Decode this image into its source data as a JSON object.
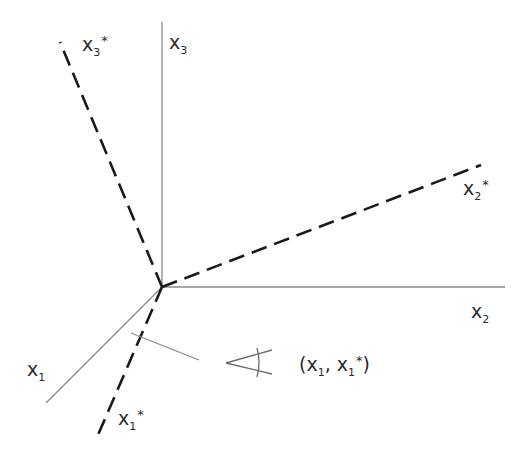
{
  "diagram": {
    "title": "",
    "origin": [
      162,
      287
    ],
    "axes": [
      {
        "id": "x3",
        "label": "x",
        "sub": "3",
        "star": "",
        "style": "solid",
        "end": [
          162,
          22
        ]
      },
      {
        "id": "x2",
        "label": "x",
        "sub": "2",
        "star": "",
        "style": "solid",
        "end": [
          505,
          287
        ]
      },
      {
        "id": "x1",
        "label": "x",
        "sub": "1",
        "star": "",
        "style": "solid",
        "end": [
          46,
          403
        ]
      },
      {
        "id": "x3star",
        "label": "x",
        "sub": "3",
        "star": "*",
        "style": "dashed",
        "end": [
          60,
          42
        ]
      },
      {
        "id": "x2star",
        "label": "x",
        "sub": "2",
        "star": "*",
        "style": "dashed",
        "end": [
          481,
          165
        ]
      },
      {
        "id": "x1star",
        "label": "x",
        "sub": "1",
        "star": "*",
        "style": "dashed",
        "end": [
          98,
          435
        ]
      }
    ],
    "angle_annotation": {
      "text_open": "(x",
      "sub1": "1",
      "text_mid": ", x",
      "sub2": "1",
      "star": "*",
      "text_close": ")"
    },
    "colors": {
      "solid_axis": "#8a8a8a",
      "dashed_axis": "#1a1a1a",
      "text": "#2a2a2a"
    }
  }
}
